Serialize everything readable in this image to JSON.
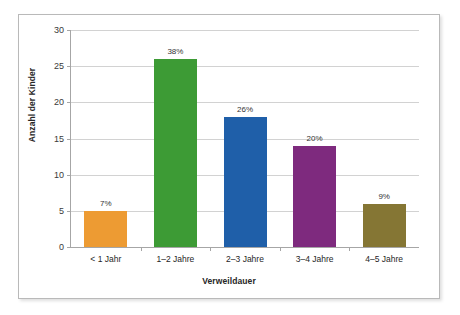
{
  "chart_data": {
    "type": "bar",
    "title": "",
    "xlabel": "Verweildauer",
    "ylabel": "Anzahl der Kinder",
    "categories": [
      "< 1 Jahr",
      "1–2 Jahre",
      "2–3 Jahre",
      "3–4 Jahre",
      "4–5 Jahre"
    ],
    "values": [
      5,
      26,
      18,
      14,
      6
    ],
    "data_labels": [
      "7%",
      "38%",
      "26%",
      "20%",
      "9%"
    ],
    "bar_colors": [
      "#ED9B33",
      "#3D9B35",
      "#1F5FA9",
      "#7E2A7E",
      "#857634"
    ],
    "ylim": [
      0,
      30
    ],
    "ytick_values": [
      0,
      5,
      10,
      15,
      20,
      25,
      30
    ],
    "ytick_labels": [
      "0",
      "5",
      "10",
      "15",
      "20",
      "25",
      "30"
    ],
    "grid": true,
    "legend": false,
    "legend_position": "none"
  },
  "figure": {
    "border_color": "#b9b9b9",
    "background": "#ffffff",
    "gridline_color": "#d2d2d2",
    "axis_color": "#a6a6a6"
  }
}
